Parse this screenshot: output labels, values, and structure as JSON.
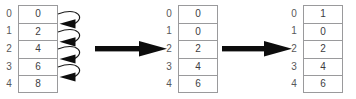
{
  "diagram": {
    "background": "#ffffff",
    "cell_border_color": "#9a9a9c",
    "index_color": "#58585a",
    "value_color": "#3d3d3f",
    "arrow_color": "#000000",
    "indices": [
      "0",
      "1",
      "2",
      "3",
      "4"
    ],
    "arrays": [
      {
        "id": "array-left",
        "name": "initial-array",
        "values": [
          "0",
          "2",
          "4",
          "6",
          "8"
        ],
        "loop_arrows": [
          {
            "from_index": "0",
            "to_index": "1",
            "name": "shift-arrow-0-to-1"
          },
          {
            "from_index": "1",
            "to_index": "2",
            "name": "shift-arrow-1-to-2"
          },
          {
            "from_index": "2",
            "to_index": "3",
            "name": "shift-arrow-2-to-3"
          },
          {
            "from_index": "3",
            "to_index": "4",
            "name": "shift-arrow-3-to-4"
          }
        ]
      },
      {
        "id": "array-mid",
        "name": "shifted-array",
        "values": [
          "0",
          "0",
          "2",
          "4",
          "6"
        ],
        "loop_arrows": []
      },
      {
        "id": "array-right",
        "name": "final-array",
        "values": [
          "1",
          "0",
          "2",
          "4",
          "6"
        ],
        "loop_arrows": []
      }
    ],
    "transitions": [
      {
        "name": "transition-arrow-1",
        "direction": "right"
      },
      {
        "name": "transition-arrow-2",
        "direction": "right"
      }
    ]
  }
}
